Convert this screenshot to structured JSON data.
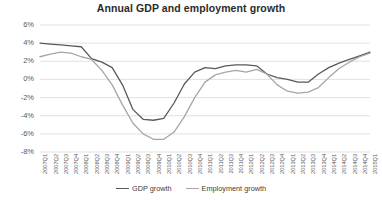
{
  "chart_data": {
    "type": "line",
    "title": "Annual GDP and employment growth",
    "xlabel": "",
    "ylabel": "",
    "ylim": [
      -8,
      6
    ],
    "ytick_labels": [
      "6%",
      "4%",
      "2%",
      "0%",
      "-2%",
      "-4%",
      "-6%",
      "-8%"
    ],
    "ytick_values": [
      6,
      4,
      2,
      0,
      -2,
      -4,
      -6,
      -8
    ],
    "grid": true,
    "legend_position": "bottom",
    "categories": [
      "2007Q1",
      "2007Q2",
      "2007Q3",
      "2007Q4",
      "2008Q1",
      "2008Q2",
      "2008Q3",
      "2008Q4",
      "2009Q1",
      "2009Q2",
      "2009Q3",
      "2009Q4",
      "2010Q1",
      "2010Q2",
      "2010Q3",
      "2010Q4",
      "2011Q1",
      "2011Q2",
      "2011Q3",
      "2011Q4",
      "2012Q1",
      "2012Q2",
      "2012Q3",
      "2012Q4",
      "2013Q1",
      "2013Q2",
      "2013Q3",
      "2013Q4",
      "2014Q1",
      "2014Q2",
      "2014Q3",
      "2014Q4",
      "2015Q1"
    ],
    "series": [
      {
        "name": "GDP growth",
        "color": "#595959",
        "values": [
          4.0,
          3.9,
          3.8,
          3.7,
          3.6,
          2.3,
          1.9,
          1.3,
          -0.6,
          -3.3,
          -4.4,
          -4.5,
          -4.3,
          -2.6,
          -0.5,
          0.8,
          1.3,
          1.2,
          1.5,
          1.6,
          1.6,
          1.5,
          0.6,
          0.2,
          0.0,
          -0.3,
          -0.3,
          0.6,
          1.3,
          1.8,
          2.2,
          2.6,
          3.0
        ]
      },
      {
        "name": "Employment growth",
        "color": "#a6a6a6",
        "values": [
          2.5,
          2.8,
          3.0,
          2.9,
          2.5,
          2.2,
          1.0,
          -0.6,
          -2.8,
          -4.8,
          -6.0,
          -6.6,
          -6.6,
          -5.8,
          -4.1,
          -2.0,
          -0.3,
          0.5,
          0.8,
          1.0,
          0.8,
          1.1,
          0.6,
          -0.6,
          -1.3,
          -1.5,
          -1.4,
          -0.9,
          0.2,
          1.2,
          1.9,
          2.5,
          2.9
        ]
      }
    ]
  },
  "legend": {
    "items": [
      {
        "label": "GDP growth",
        "color": "#595959"
      },
      {
        "label": "Employment growth",
        "color": "#a6a6a6"
      }
    ]
  },
  "axes": {
    "gridline_color": "#d9d9d9",
    "axis_color": "#d9d9d9"
  }
}
